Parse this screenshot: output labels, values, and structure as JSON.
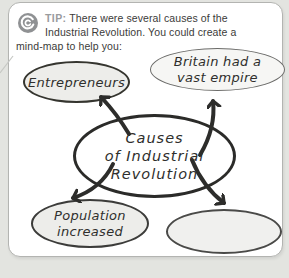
{
  "colors": {
    "page_background": "#e3e4e0",
    "card_background": "#ffffff",
    "card_border": "#b3b4b1",
    "tip_gray": "#9a9c9e",
    "body_text": "#3b3b39",
    "ink": "#2d2d2b",
    "node_fill_shaded": "#ededea",
    "node_fill_light": "#f6f6f4"
  },
  "tip": {
    "icon": "spiral-target-icon",
    "label": "TIP:",
    "lines": [
      "There were several causes of the",
      "Industrial Revolution. You could create a",
      "mind-map to help you:"
    ]
  },
  "mindmap": {
    "center": {
      "lines": [
        "Causes",
        "of Industrial",
        "Revolution"
      ]
    },
    "nodes": {
      "entrepreneurs": {
        "label": "Entrepreneurs"
      },
      "britain": {
        "lines": [
          "Britain had a",
          "vast empire"
        ]
      },
      "population": {
        "lines": [
          "Population",
          "increased"
        ]
      },
      "empty": {
        "label": ""
      }
    },
    "arrows": [
      "center-to-entrepreneurs",
      "center-to-britain",
      "center-to-population",
      "center-to-empty"
    ]
  }
}
